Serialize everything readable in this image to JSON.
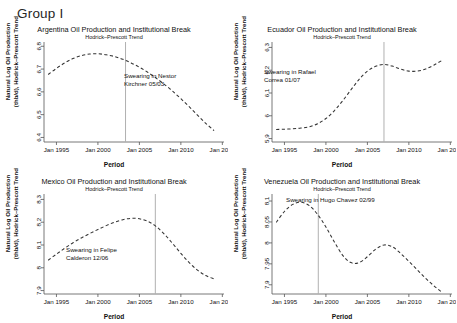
{
  "figure": {
    "group_label": "Group I",
    "xlabel": "Period",
    "ylabel_line1": "Natural Log Oil Production",
    "ylabel_line2": "(thb/d), Hodrick–Prescott Trend",
    "subtitle": "Hodrick–Prescott Trend",
    "xticks": [
      "Jan 1995",
      "Jan 2000",
      "Jan 2005",
      "Jan 2010",
      "Jan 2015"
    ],
    "line_color": "#333333",
    "break_line_color": "#b0b0b0",
    "background": "#ffffff"
  },
  "chart_data": [
    {
      "type": "line",
      "id": "argentina",
      "title": "Argentina Oil Production and Institutional Break",
      "subtitle": "Hodrick–Prescott Trend",
      "xlabel": "Period",
      "ylabel": "Natural Log Oil Production (thb/d), Hodrick–Prescott Trend",
      "annotation": "Swearing in Nestor Kirchner 05/03",
      "annotation_line1": "Swearing in Nestor",
      "annotation_line2": "Kirchner 05/03",
      "break_date": "2003.33",
      "grid": false,
      "legend": "none",
      "linestyle": "dashed",
      "xlim": [
        1993.5,
        2015.2
      ],
      "ylim": [
        6.38,
        6.81
      ],
      "yticks": [
        "6.4",
        "6.5",
        "6.6",
        "6.7",
        "6.8"
      ],
      "ytick_values": [
        6.4,
        6.5,
        6.6,
        6.7,
        6.8
      ],
      "xtick_values": [
        1995,
        2000,
        2005,
        2010,
        2015
      ],
      "x": [
        1994.0,
        1995.0,
        1996.0,
        1997.0,
        1998.0,
        1999.0,
        2000.0,
        2001.0,
        2002.0,
        2003.0,
        2004.0,
        2005.0,
        2006.0,
        2007.0,
        2008.0,
        2009.0,
        2010.0,
        2011.0,
        2012.0,
        2013.0,
        2014.0
      ],
      "y": [
        6.676,
        6.703,
        6.727,
        6.746,
        6.759,
        6.766,
        6.767,
        6.763,
        6.755,
        6.743,
        6.727,
        6.708,
        6.686,
        6.661,
        6.633,
        6.603,
        6.57,
        6.535,
        6.498,
        6.462,
        6.43
      ]
    },
    {
      "type": "line",
      "id": "ecuador",
      "title": "Ecuador Oil Production and Institutional Break",
      "subtitle": "Hodrick–Prescott Trend",
      "xlabel": "Period",
      "ylabel": "Natural Log Oil Production (thb/d), Hodrick–Prescott Trend",
      "annotation": "Swearing in Rafael Correa 01/07",
      "annotation_line1": "Swearing in Rafael",
      "annotation_line2": "Correa 01/07",
      "break_date": "2007.0",
      "grid": false,
      "legend": "none",
      "linestyle": "dashed",
      "xlim": [
        1993.5,
        2015.2
      ],
      "ylim": [
        5.885,
        6.315
      ],
      "yticks": [
        "5.9",
        "6",
        "6.1",
        "6.2",
        "6.3"
      ],
      "ytick_values": [
        5.9,
        6.0,
        6.1,
        6.2,
        6.3
      ],
      "xtick_values": [
        1995,
        2000,
        2005,
        2010,
        2015
      ],
      "x": [
        1994.0,
        1995.0,
        1996.0,
        1997.0,
        1998.0,
        1999.0,
        2000.0,
        2001.0,
        2002.0,
        2003.0,
        2004.0,
        2005.0,
        2006.0,
        2007.0,
        2008.0,
        2009.0,
        2010.0,
        2011.0,
        2012.0,
        2013.0,
        2014.0
      ],
      "y": [
        5.94,
        5.941,
        5.943,
        5.946,
        5.952,
        5.965,
        5.988,
        6.022,
        6.065,
        6.113,
        6.16,
        6.196,
        6.217,
        6.225,
        6.218,
        6.205,
        6.196,
        6.196,
        6.205,
        6.222,
        6.243
      ]
    },
    {
      "type": "line",
      "id": "mexico",
      "title": "Mexico Oil Production and Institutional Break",
      "subtitle": "Hodrick–Prescott Trend",
      "xlabel": "Period",
      "ylabel": "Natural Log Oil Production (thb/d), Hodrick–Prescott Trend",
      "annotation": "Swearing in Felipe Calderon 12/06",
      "annotation_line1": "Swearing in Felipe",
      "annotation_line2": "Calderon 12/06",
      "break_date": "2006.92",
      "grid": false,
      "legend": "none",
      "linestyle": "dashed",
      "xlim": [
        1993.5,
        2015.2
      ],
      "ylim": [
        7.885,
        8.315
      ],
      "yticks": [
        "7.9",
        "8",
        "8.1",
        "8.2",
        "8.3"
      ],
      "ytick_values": [
        7.9,
        8.0,
        8.1,
        8.2,
        8.3
      ],
      "xtick_values": [
        1995,
        2000,
        2005,
        2010,
        2015
      ],
      "x": [
        1994.0,
        1995.0,
        1996.0,
        1997.0,
        1998.0,
        1999.0,
        2000.0,
        2001.0,
        2002.0,
        2003.0,
        2004.0,
        2005.0,
        2006.0,
        2007.0,
        2008.0,
        2009.0,
        2010.0,
        2011.0,
        2012.0,
        2013.0,
        2014.0
      ],
      "y": [
        8.033,
        8.06,
        8.086,
        8.11,
        8.131,
        8.15,
        8.168,
        8.185,
        8.2,
        8.211,
        8.217,
        8.215,
        8.204,
        8.182,
        8.148,
        8.107,
        8.063,
        8.023,
        7.99,
        7.966,
        7.951
      ]
    },
    {
      "type": "line",
      "id": "venezuela",
      "title": "Venezuela Oil Production and Institutional Break",
      "subtitle": "Hodrick–Prescott Trend",
      "xlabel": "Period",
      "ylabel": "Natural Log Oil Production (thb/d), Hodrick–Prescott Trend",
      "annotation": "Swearing in Hugo Chavez 02/99",
      "annotation_line1": "Swearing in Hugo Chavez 02/99",
      "annotation_line2": "",
      "break_date": "1999.08",
      "grid": false,
      "legend": "none",
      "linestyle": "dashed",
      "xlim": [
        1993.5,
        2015.2
      ],
      "ylim": [
        7.878,
        8.112
      ],
      "yticks": [
        "7.9",
        "7.95",
        "8",
        "8.05",
        "8.1"
      ],
      "ytick_values": [
        7.9,
        7.95,
        8.0,
        8.05,
        8.1
      ],
      "xtick_values": [
        1995,
        2000,
        2005,
        2010,
        2015
      ],
      "x": [
        1994.0,
        1995.0,
        1996.0,
        1997.0,
        1998.0,
        1999.0,
        2000.0,
        2001.0,
        2002.0,
        2003.0,
        2004.0,
        2005.0,
        2006.0,
        2007.0,
        2008.0,
        2009.0,
        2010.0,
        2011.0,
        2012.0,
        2013.0,
        2014.0
      ],
      "y": [
        8.049,
        8.075,
        8.092,
        8.097,
        8.089,
        8.068,
        8.038,
        8.003,
        7.971,
        7.953,
        7.953,
        7.967,
        7.985,
        7.995,
        7.991,
        7.975,
        7.956,
        7.936,
        7.916,
        7.898,
        7.882
      ]
    }
  ]
}
